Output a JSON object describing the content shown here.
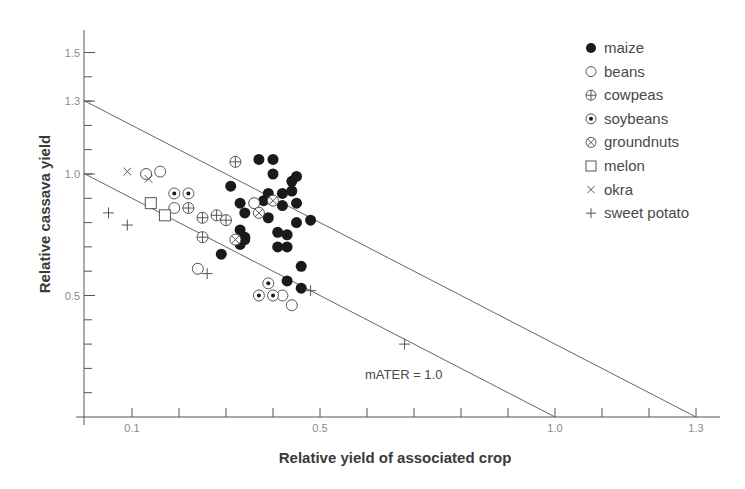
{
  "chart_data": {
    "type": "scatter",
    "title": "",
    "xlabel": "Relative yield of associated crop",
    "ylabel": "Relative cassava yield",
    "xlim": [
      0,
      1.3
    ],
    "ylim": [
      0,
      1.55
    ],
    "x_ticks_labeled": [
      0.1,
      0.5,
      1.0,
      1.3
    ],
    "x_tick_labels": [
      "0.1",
      "0.5",
      "1.0",
      "1.3"
    ],
    "x_ticks_minor": [
      0.1,
      0.2,
      0.3,
      0.4,
      0.5,
      0.6,
      0.7,
      0.8,
      0.9,
      1.0,
      1.1,
      1.2,
      1.3
    ],
    "y_ticks_labeled": [
      0.5,
      1.0,
      1.3,
      1.5
    ],
    "y_tick_labels": [
      "0.5",
      "1.0",
      "1.3",
      "1.5"
    ],
    "y_ticks_minor": [
      0.1,
      0.2,
      0.3,
      0.4,
      0.5,
      0.6,
      0.7,
      0.8,
      0.9,
      1.0,
      1.1,
      1.2,
      1.3,
      1.4,
      1.5
    ],
    "grid": false,
    "legend_position": "upper right",
    "reference_lines": [
      {
        "name": "mATER = 1.0",
        "from": [
          0,
          1.0
        ],
        "to": [
          1.0,
          0
        ]
      },
      {
        "name": "mATER = 1.3",
        "from": [
          0,
          1.3
        ],
        "to": [
          1.3,
          0
        ]
      }
    ],
    "annotations": [
      {
        "text": "mATER = 1.0",
        "x": 0.6,
        "y": 0.16
      }
    ],
    "series": [
      {
        "name": "maize",
        "marker": "filled-circle",
        "points": [
          [
            0.37,
            1.06
          ],
          [
            0.4,
            1.06
          ],
          [
            0.4,
            1.0
          ],
          [
            0.44,
            0.97
          ],
          [
            0.45,
            0.99
          ],
          [
            0.31,
            0.95
          ],
          [
            0.39,
            0.92
          ],
          [
            0.42,
            0.92
          ],
          [
            0.44,
            0.93
          ],
          [
            0.45,
            0.88
          ],
          [
            0.33,
            0.88
          ],
          [
            0.36,
            0.88
          ],
          [
            0.38,
            0.89
          ],
          [
            0.42,
            0.87
          ],
          [
            0.34,
            0.84
          ],
          [
            0.39,
            0.82
          ],
          [
            0.45,
            0.8
          ],
          [
            0.48,
            0.81
          ],
          [
            0.33,
            0.77
          ],
          [
            0.41,
            0.76
          ],
          [
            0.43,
            0.75
          ],
          [
            0.34,
            0.74
          ],
          [
            0.34,
            0.73
          ],
          [
            0.33,
            0.71
          ],
          [
            0.41,
            0.7
          ],
          [
            0.43,
            0.7
          ],
          [
            0.29,
            0.67
          ],
          [
            0.46,
            0.62
          ],
          [
            0.43,
            0.56
          ],
          [
            0.46,
            0.53
          ]
        ]
      },
      {
        "name": "beans",
        "marker": "open-circle",
        "points": [
          [
            0.13,
            1.0
          ],
          [
            0.16,
            1.01
          ],
          [
            0.36,
            0.88
          ],
          [
            0.19,
            0.86
          ],
          [
            0.24,
            0.61
          ],
          [
            0.42,
            0.5
          ],
          [
            0.44,
            0.46
          ]
        ]
      },
      {
        "name": "cowpeas",
        "marker": "circle-plus",
        "points": [
          [
            0.32,
            1.05
          ],
          [
            0.22,
            0.86
          ],
          [
            0.25,
            0.82
          ],
          [
            0.28,
            0.83
          ],
          [
            0.3,
            0.81
          ],
          [
            0.25,
            0.74
          ]
        ]
      },
      {
        "name": "soybeans",
        "marker": "circle-dot",
        "points": [
          [
            0.19,
            0.92
          ],
          [
            0.22,
            0.92
          ],
          [
            0.39,
            0.55
          ],
          [
            0.37,
            0.5
          ],
          [
            0.4,
            0.5
          ]
        ]
      },
      {
        "name": "groundnuts",
        "marker": "circle-x",
        "points": [
          [
            0.4,
            0.89
          ],
          [
            0.37,
            0.84
          ],
          [
            0.32,
            0.73
          ]
        ]
      },
      {
        "name": "melon",
        "marker": "open-square",
        "points": [
          [
            0.14,
            0.88
          ],
          [
            0.17,
            0.83
          ]
        ]
      },
      {
        "name": "okra",
        "marker": "x",
        "points": [
          [
            0.09,
            1.01
          ],
          [
            0.135,
            0.98
          ]
        ]
      },
      {
        "name": "sweet potato",
        "marker": "plus",
        "points": [
          [
            0.05,
            0.84
          ],
          [
            0.09,
            0.79
          ],
          [
            0.26,
            0.59
          ],
          [
            0.48,
            0.52
          ],
          [
            0.68,
            0.3
          ]
        ]
      }
    ]
  },
  "legend": {
    "items": [
      {
        "label": "maize",
        "marker": "filled-circle"
      },
      {
        "label": "beans",
        "marker": "open-circle"
      },
      {
        "label": "cowpeas",
        "marker": "circle-plus"
      },
      {
        "label": "soybeans",
        "marker": "circle-dot"
      },
      {
        "label": "groundnuts",
        "marker": "circle-x"
      },
      {
        "label": "melon",
        "marker": "open-square"
      },
      {
        "label": "okra",
        "marker": "x"
      },
      {
        "label": "sweet potato",
        "marker": "plus"
      }
    ]
  },
  "colors": {
    "axis": "#555555",
    "line": "#666666",
    "marker_fill": "#1a1a1a",
    "marker_stroke": "#555555",
    "tick_label": "#8a8a8a",
    "title": "#3a3a3a"
  }
}
